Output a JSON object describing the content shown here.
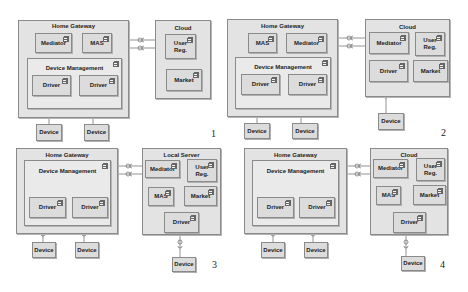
{
  "panels": [
    {
      "number": "1",
      "gateway": {
        "title": "Home Gateway",
        "components": [
          "Mediator",
          "MAS"
        ],
        "device_management": {
          "title": "Device Management",
          "drivers": [
            "Driver",
            "Driver"
          ]
        }
      },
      "remote": {
        "title": "Cloud",
        "components": [
          "User Reg.",
          "Market"
        ]
      },
      "devices": [
        "Device",
        "Device"
      ]
    },
    {
      "number": "2",
      "gateway": {
        "title": "Home Gateway",
        "components": [
          "MAS",
          "Mediator"
        ],
        "device_management": {
          "title": "Device Management",
          "drivers": [
            "Driver",
            "Driver"
          ]
        }
      },
      "remote": {
        "title": "Cloud",
        "components": [
          "Mediator",
          "User Reg.",
          "Driver",
          "Market"
        ]
      },
      "devices": [
        "Device",
        "Device",
        "Device"
      ]
    },
    {
      "number": "3",
      "gateway": {
        "title": "Home Gateway",
        "components": [],
        "device_management": {
          "title": "Device Management",
          "drivers": [
            "Driver",
            "Driver"
          ]
        }
      },
      "remote": {
        "title": "Local Server",
        "components": [
          "Mediator",
          "User Reg.",
          "MAS",
          "Market",
          "Driver"
        ]
      },
      "devices": [
        "Device",
        "Device",
        "Device"
      ]
    },
    {
      "number": "4",
      "gateway": {
        "title": "Home Gateway",
        "components": [],
        "device_management": {
          "title": "Device Management",
          "drivers": [
            "Driver",
            "Driver"
          ]
        }
      },
      "remote": {
        "title": "Cloud",
        "components": [
          "Mediator",
          "User Reg.",
          "MAS",
          "Market",
          "Driver"
        ]
      },
      "devices": [
        "Device",
        "Device",
        "Device"
      ]
    }
  ],
  "colors": {
    "node_fill": "#e3e3e3",
    "component_fill": "#dcdcdc",
    "border": "#8a8a8a"
  }
}
